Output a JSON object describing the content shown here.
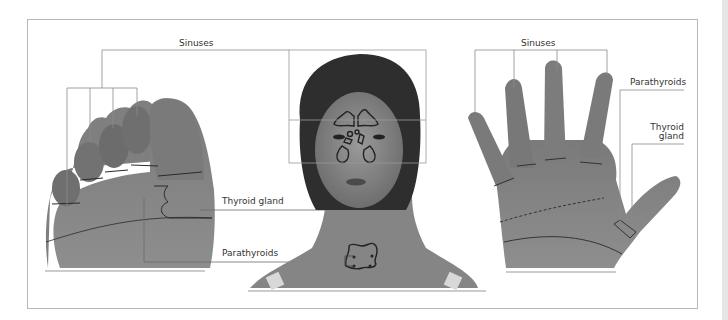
{
  "diagram": {
    "panels": [
      {
        "name": "foot",
        "description": "Sole of foot with reflex zones"
      },
      {
        "name": "face",
        "description": "Face and neck with sinuses, thyroid gland and parathyroids outlined"
      },
      {
        "name": "hand",
        "description": "Palm of hand with reflex zones"
      }
    ],
    "labels": {
      "sinuses_left": "Sinuses",
      "thyroid_gland_center": "Thyroid gland",
      "parathyroids_center": "Parathyroids",
      "sinuses_right": "Sinuses",
      "parathyroids_right": "Parathyroids",
      "thyroid_right_line1": "Thyroid",
      "thyroid_right_line2": "gland"
    },
    "colors": {
      "frame": "#b8b8b8",
      "leader_line": "#8a8a8a",
      "outline": "#2a2a2a",
      "skin_dark": "#6e6e6e",
      "skin_mid": "#8c8c8c",
      "text": "#333333"
    }
  }
}
